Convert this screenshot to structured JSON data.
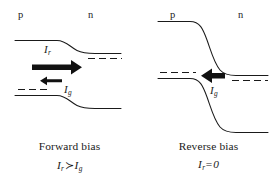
{
  "figure": {
    "ink_color": "#1a1a1a",
    "background_color": "#ffffff",
    "panels": [
      {
        "id": "forward",
        "region_left_label": "p",
        "region_right_label": "n",
        "current_labels": [
          {
            "symbol": "I",
            "subscript": "r",
            "name": "recombination-current"
          },
          {
            "symbol": "I",
            "subscript": "g",
            "name": "generation-current"
          }
        ],
        "arrows": [
          {
            "name": "recombination-current-arrow",
            "direction": "right",
            "size": "large"
          },
          {
            "name": "generation-current-arrow",
            "direction": "left",
            "size": "small"
          }
        ],
        "caption_title": "Forward bias",
        "caption_equation": {
          "left_symbol": "I",
          "left_sub": "r",
          "operator": "≻",
          "right_symbol": "I",
          "right_sub": "g"
        }
      },
      {
        "id": "reverse",
        "region_left_label": "p",
        "region_right_label": "n",
        "current_labels": [
          {
            "symbol": "I",
            "subscript": "g",
            "name": "generation-current"
          }
        ],
        "arrows": [
          {
            "name": "generation-current-arrow",
            "direction": "left",
            "size": "medium"
          }
        ],
        "caption_title": "Reverse bias",
        "caption_equation": {
          "left_symbol": "I",
          "left_sub": "r",
          "operator": "=",
          "right_symbol": "0",
          "right_sub": ""
        }
      }
    ]
  }
}
